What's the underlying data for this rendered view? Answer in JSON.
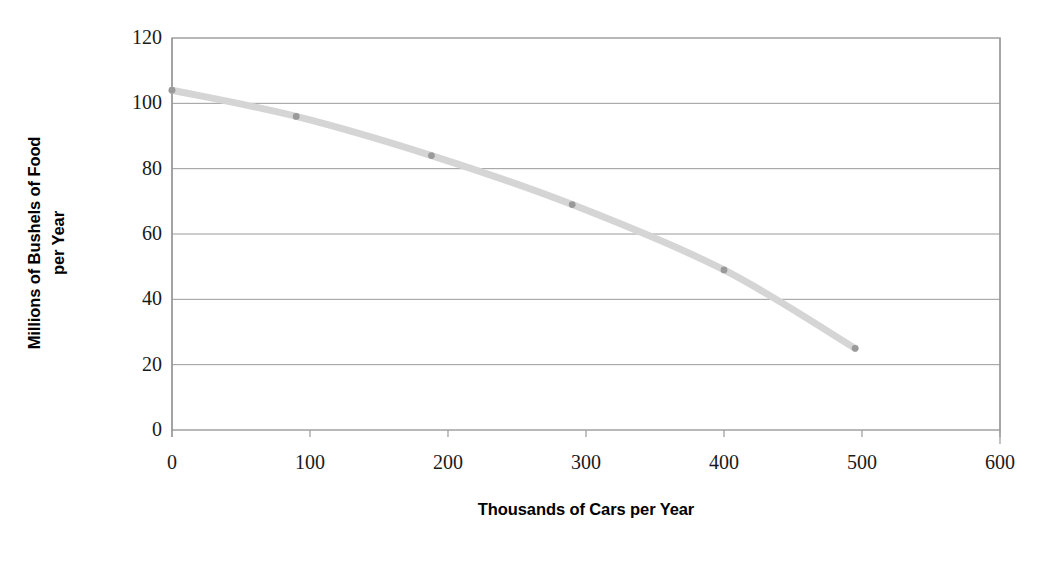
{
  "chart_data": {
    "type": "line",
    "title": "",
    "subtitle": "",
    "xlabel": "Thousands of Cars per Year",
    "ylabel": "Millions of Bushels of Food per Year",
    "ylabel_line1": "Millions of Bushels of Food",
    "ylabel_line2": "per Year",
    "xlim": [
      0,
      600
    ],
    "ylim": [
      0,
      120
    ],
    "xticks": [
      0,
      100,
      200,
      300,
      400,
      500,
      600
    ],
    "yticks": [
      0,
      20,
      40,
      60,
      80,
      100,
      120
    ],
    "xtick_labels": [
      "0",
      "100",
      "200",
      "300",
      "400",
      "500",
      "600"
    ],
    "ytick_labels": [
      "0",
      "20",
      "40",
      "60",
      "80",
      "100",
      "120"
    ],
    "grid": "horizontal",
    "legend": "none",
    "series": [
      {
        "name": "Production Possibilities Frontier",
        "color": "#d5d5d5",
        "marker_color": "#9a9a9a",
        "line_width": 7,
        "smooth": true,
        "x": [
          0,
          90,
          188,
          290,
          400,
          495
        ],
        "y": [
          104,
          96,
          84,
          69,
          49,
          25
        ],
        "points": [
          {
            "x": 0,
            "y": 104
          },
          {
            "x": 90,
            "y": 96
          },
          {
            "x": 188,
            "y": 84
          },
          {
            "x": 290,
            "y": 69
          },
          {
            "x": 400,
            "y": 49
          },
          {
            "x": 495,
            "y": 25
          }
        ]
      }
    ]
  },
  "axes": {
    "frame_color": "#9a9a9a",
    "gridline_color": "#9a9a9a",
    "tick_text_color": "#1a1a1a",
    "background": "#ffffff"
  }
}
